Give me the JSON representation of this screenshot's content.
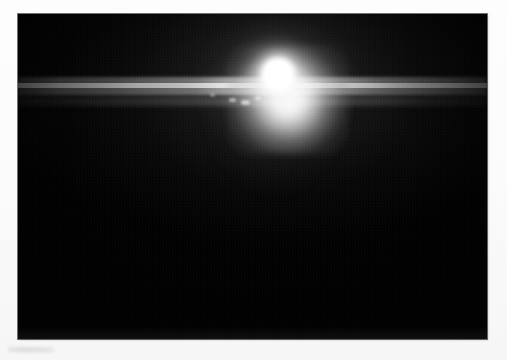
{
  "page": {
    "background_color": "#fdfdfd",
    "width": 507,
    "height": 360,
    "caption_ghost_alt": "faint-unreadable-smudge"
  },
  "photograph": {
    "alt": "Dark photograph dominated by an intense blown-out point light source near upper centre, with a full-width horizontal lens-flare streak and a downward glow cone",
    "frame": {
      "left": 18,
      "top": 14,
      "width": 469,
      "height": 325
    },
    "background_color": "#000000",
    "subject": "bright-light-source",
    "scene_tone": "near-black",
    "print_texture": "halftone-dither",
    "elements": [
      {
        "name": "saturated-core",
        "color": "#ffffff",
        "center_x_pct": 55.4,
        "center_y_pct": 18.5
      },
      {
        "name": "core-halo",
        "color": "#f0f0f0"
      },
      {
        "name": "horizontal-flare-streak",
        "color": "#e6e6e6",
        "y_pct": 21.5,
        "spans": "full-width"
      },
      {
        "name": "secondary-flare-streak",
        "color": "#9a9a9a",
        "y_pct": 26.5
      },
      {
        "name": "downward-glow-cone",
        "color": "#c8c8c8"
      },
      {
        "name": "upward-glow-cone",
        "color": "#bebebe"
      },
      {
        "name": "flare-specks",
        "color": "#ffffff",
        "count": 4
      },
      {
        "name": "vignette",
        "color": "#000000"
      }
    ]
  }
}
